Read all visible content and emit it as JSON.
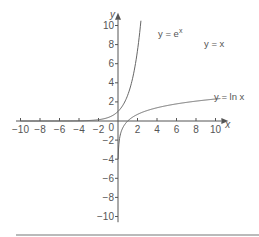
{
  "chart_data": {
    "type": "line",
    "title": "",
    "xlabel": "x",
    "ylabel": "y",
    "xlim": [
      -10,
      10
    ],
    "ylim": [
      -10,
      10
    ],
    "grid": false,
    "x_ticks": [
      -10,
      -8,
      -6,
      -4,
      -2,
      2,
      4,
      6,
      8,
      10
    ],
    "y_ticks": [
      10,
      8,
      6,
      4,
      2,
      -2,
      -4,
      -6,
      -8,
      -10
    ],
    "origin_label": "0",
    "series": [
      {
        "name": "y = e^x",
        "label": "y = e",
        "label_sup": "x",
        "style": "solid",
        "x": [
          -10,
          -4,
          -2,
          -1,
          0,
          1,
          1.5,
          2,
          2.3
        ],
        "y": [
          0.0,
          0.02,
          0.14,
          0.37,
          1,
          2.72,
          4.48,
          7.39,
          9.97
        ]
      },
      {
        "name": "y = x",
        "label": "y = x",
        "style": "dashed",
        "x": [
          -10,
          10
        ],
        "y": [
          -10,
          10
        ]
      },
      {
        "name": "y = ln x",
        "label": "y = ln x",
        "style": "solid",
        "x": [
          0.02,
          0.1,
          0.5,
          1,
          2,
          4,
          6,
          8,
          10
        ],
        "y": [
          -3.9,
          -2.3,
          -0.69,
          0,
          0.69,
          1.39,
          1.79,
          2.08,
          2.3
        ]
      }
    ]
  }
}
